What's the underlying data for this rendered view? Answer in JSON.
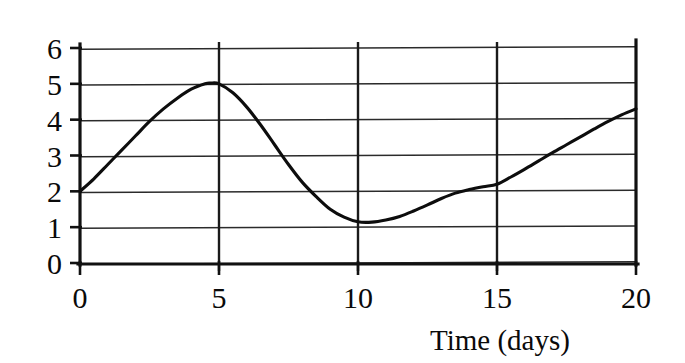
{
  "chart_data": {
    "type": "line",
    "title": "",
    "subtitle": "",
    "xlabel": "Time (days)",
    "ylabel": "",
    "xlim": [
      0,
      20
    ],
    "ylim": [
      0,
      6
    ],
    "grid": "horizontal and vertical gridlines at every tick",
    "legend": "none",
    "xticks": [
      0,
      5,
      10,
      15,
      20
    ],
    "yticks": [
      0,
      1,
      2,
      3,
      4,
      5,
      6
    ],
    "xtick_labels": [
      "0",
      "5",
      "10",
      "15",
      "20"
    ],
    "ytick_labels": [
      "0",
      "1",
      "2",
      "3",
      "4",
      "5",
      "6"
    ],
    "annotations": [],
    "series": [
      {
        "name": "value",
        "x": [
          0,
          0.5,
          1,
          1.5,
          2,
          2.5,
          3,
          3.5,
          4,
          4.5,
          4.7,
          5,
          5.5,
          6,
          6.5,
          7,
          7.5,
          8,
          8.5,
          9,
          9.5,
          10,
          10.5,
          11,
          11.5,
          12,
          12.5,
          13,
          13.5,
          14,
          14.5,
          15,
          15.5,
          16,
          16.5,
          17,
          17.5,
          18,
          18.5,
          19,
          19.5,
          20
        ],
        "y": [
          2.0,
          2.35,
          2.75,
          3.15,
          3.55,
          3.95,
          4.3,
          4.6,
          4.85,
          5.0,
          5.02,
          5.0,
          4.75,
          4.35,
          3.85,
          3.3,
          2.75,
          2.25,
          1.85,
          1.5,
          1.28,
          1.15,
          1.14,
          1.2,
          1.3,
          1.45,
          1.62,
          1.8,
          1.95,
          2.05,
          2.13,
          2.2,
          2.4,
          2.62,
          2.85,
          3.08,
          3.3,
          3.52,
          3.74,
          3.95,
          4.14,
          4.3
        ]
      }
    ],
    "key_points": {
      "start": {
        "x": 0,
        "y": 2.0
      },
      "maximum": {
        "x": 4.7,
        "y": 5.0
      },
      "minimum": {
        "x": 10.3,
        "y": 1.15
      },
      "end": {
        "x": 20,
        "y": 4.3
      },
      "crossing_at_15": 2.2
    }
  },
  "axes": {
    "x_axis_title": "Time (days)"
  }
}
